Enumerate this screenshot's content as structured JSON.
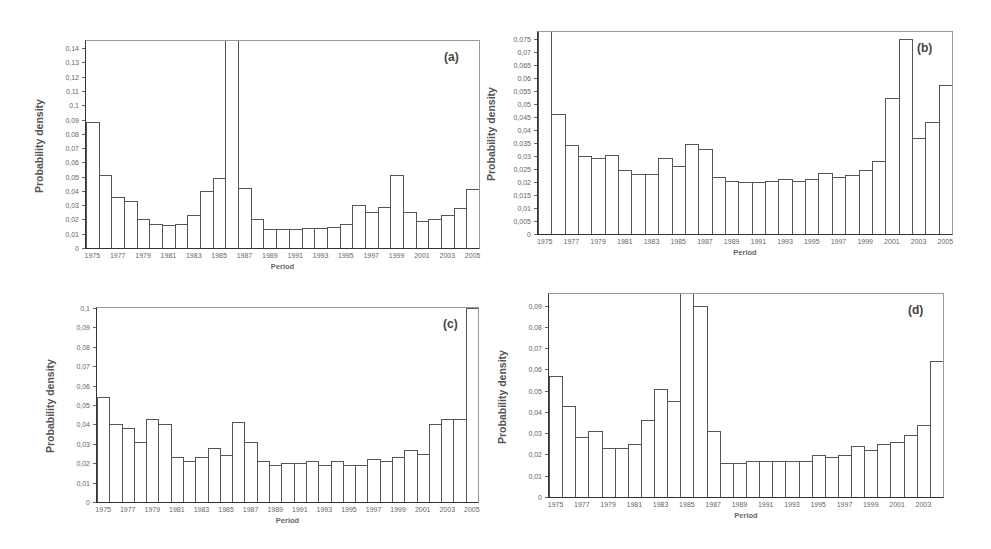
{
  "chart_data": [
    {
      "id": "a",
      "type": "bar",
      "panel_label": "(a)",
      "title": "",
      "xlabel": "Period",
      "ylabel": "Probability density",
      "ylim": [
        0,
        0.145
      ],
      "yticks": [
        "0",
        "0,01",
        "0,02",
        "0,03",
        "0,04",
        "0,05",
        "0,06",
        "0,07",
        "0,08",
        "0,09",
        "0,1",
        "0,11",
        "0,12",
        "0,13",
        "0,14"
      ],
      "ytick_values": [
        0,
        0.01,
        0.02,
        0.03,
        0.04,
        0.05,
        0.06,
        0.07,
        0.08,
        0.09,
        0.1,
        0.11,
        0.12,
        0.13,
        0.14
      ],
      "xtick_labels": [
        "1975",
        "1977",
        "1979",
        "1981",
        "1983",
        "1985",
        "1987",
        "1989",
        "1991",
        "1993",
        "1995",
        "1997",
        "1999",
        "2001",
        "2003",
        "2005"
      ],
      "categories": [
        "1975",
        "1976",
        "1977",
        "1978",
        "1979",
        "1980",
        "1981",
        "1982",
        "1983",
        "1984",
        "1985",
        "1986",
        "1987",
        "1988",
        "1989",
        "1990",
        "1991",
        "1992",
        "1993",
        "1994",
        "1995",
        "1996",
        "1997",
        "1998",
        "1999",
        "2000",
        "2001",
        "2002",
        "2003",
        "2004",
        "2005"
      ],
      "values": [
        0.088,
        0.051,
        0.036,
        0.033,
        0.02,
        0.017,
        0.016,
        0.017,
        0.023,
        0.04,
        0.049,
        0.15,
        0.042,
        0.02,
        0.013,
        0.013,
        0.013,
        0.014,
        0.014,
        0.015,
        0.017,
        0.03,
        0.025,
        0.029,
        0.051,
        0.025,
        0.019,
        0.02,
        0.023,
        0.028,
        0.041
      ],
      "grid": false,
      "legend": null
    },
    {
      "id": "b",
      "type": "bar",
      "panel_label": "(b)",
      "title": "",
      "xlabel": "Period",
      "ylabel": "Probability density",
      "ylim": [
        0,
        0.0775
      ],
      "yticks": [
        "0",
        "0,005",
        "0,01",
        "0,015",
        "0,02",
        "0,025",
        "0,03",
        "0,035",
        "0,04",
        "0,045",
        "0,05",
        "0,055",
        "0,06",
        "0,065",
        "0,07",
        "0,075"
      ],
      "ytick_values": [
        0,
        0.005,
        0.01,
        0.015,
        0.02,
        0.025,
        0.03,
        0.035,
        0.04,
        0.045,
        0.05,
        0.055,
        0.06,
        0.065,
        0.07,
        0.075
      ],
      "xtick_labels": [
        "1975",
        "1977",
        "1979",
        "1981",
        "1983",
        "1985",
        "1987",
        "1989",
        "1991",
        "1993",
        "1995",
        "1997",
        "1999",
        "2001",
        "2003",
        "2005"
      ],
      "categories": [
        "1975",
        "1976",
        "1977",
        "1978",
        "1979",
        "1980",
        "1981",
        "1982",
        "1983",
        "1984",
        "1985",
        "1986",
        "1987",
        "1988",
        "1989",
        "1990",
        "1991",
        "1992",
        "1993",
        "1994",
        "1995",
        "1996",
        "1997",
        "1998",
        "1999",
        "2000",
        "2001",
        "2002",
        "2003",
        "2004",
        "2005"
      ],
      "values": [
        0.08,
        0.046,
        0.034,
        0.03,
        0.029,
        0.0305,
        0.0245,
        0.023,
        0.023,
        0.029,
        0.026,
        0.0345,
        0.0325,
        0.022,
        0.0205,
        0.02,
        0.02,
        0.0205,
        0.021,
        0.0205,
        0.021,
        0.0235,
        0.022,
        0.0225,
        0.0245,
        0.028,
        0.052,
        0.075,
        0.037,
        0.043,
        0.057
      ],
      "grid": false,
      "legend": null
    },
    {
      "id": "c",
      "type": "bar",
      "panel_label": "(c)",
      "title": "",
      "xlabel": "Period",
      "ylabel": "Probability density",
      "ylim": [
        0,
        0.1
      ],
      "yticks": [
        "0",
        "0,01",
        "0,02",
        "0,03",
        "0,04",
        "0,05",
        "0,06",
        "0,07",
        "0,08",
        "0,09",
        "0,1"
      ],
      "ytick_values": [
        0,
        0.01,
        0.02,
        0.03,
        0.04,
        0.05,
        0.06,
        0.07,
        0.08,
        0.09,
        0.1
      ],
      "xtick_labels": [
        "1975",
        "1977",
        "1979",
        "1981",
        "1983",
        "1985",
        "1987",
        "1989",
        "1991",
        "1993",
        "1995",
        "1997",
        "1999",
        "2001",
        "2003",
        "2005"
      ],
      "categories": [
        "1975",
        "1976",
        "1977",
        "1978",
        "1979",
        "1980",
        "1981",
        "1982",
        "1983",
        "1984",
        "1985",
        "1986",
        "1987",
        "1988",
        "1989",
        "1990",
        "1991",
        "1992",
        "1993",
        "1994",
        "1995",
        "1996",
        "1997",
        "1998",
        "1999",
        "2000",
        "2001",
        "2002",
        "2003",
        "2004",
        "2005"
      ],
      "values": [
        0.054,
        0.04,
        0.038,
        0.031,
        0.043,
        0.04,
        0.023,
        0.021,
        0.023,
        0.028,
        0.024,
        0.041,
        0.031,
        0.021,
        0.019,
        0.02,
        0.02,
        0.021,
        0.019,
        0.021,
        0.019,
        0.019,
        0.022,
        0.021,
        0.023,
        0.027,
        0.025,
        0.04,
        0.043,
        0.043,
        0.1
      ],
      "grid": false,
      "legend": null
    },
    {
      "id": "d",
      "type": "bar",
      "panel_label": "(d)",
      "title": "",
      "xlabel": "Period",
      "ylabel": "Probability density",
      "ylim": [
        0,
        0.0955
      ],
      "yticks": [
        "0",
        "0,01",
        "0,02",
        "0,03",
        "0,04",
        "0,05",
        "0,06",
        "0,07",
        "0,08",
        "0,09"
      ],
      "ytick_values": [
        0,
        0.01,
        0.02,
        0.03,
        0.04,
        0.05,
        0.06,
        0.07,
        0.08,
        0.09
      ],
      "xtick_labels": [
        "1975",
        "1977",
        "1979",
        "1981",
        "1983",
        "1985",
        "1987",
        "1989",
        "1991",
        "1993",
        "1995",
        "1997",
        "1999",
        "2001",
        "2003"
      ],
      "categories": [
        "1975",
        "1976",
        "1977",
        "1978",
        "1979",
        "1980",
        "1981",
        "1982",
        "1983",
        "1984",
        "1985",
        "1986",
        "1987",
        "1988",
        "1989",
        "1990",
        "1991",
        "1992",
        "1993",
        "1994",
        "1995",
        "1996",
        "1997",
        "1998",
        "1999",
        "2000",
        "2001",
        "2002",
        "2003",
        "2004"
      ],
      "values": [
        0.057,
        0.043,
        0.028,
        0.031,
        0.023,
        0.023,
        0.025,
        0.036,
        0.051,
        0.045,
        0.1,
        0.09,
        0.031,
        0.016,
        0.016,
        0.017,
        0.017,
        0.017,
        0.017,
        0.017,
        0.02,
        0.019,
        0.02,
        0.024,
        0.022,
        0.025,
        0.026,
        0.029,
        0.034,
        0.064
      ],
      "grid": false,
      "legend": null
    }
  ],
  "layout": [
    {
      "left": 85,
      "top": 40,
      "width": 395,
      "height": 209
    },
    {
      "left": 537,
      "top": 31,
      "width": 416,
      "height": 204
    },
    {
      "left": 96,
      "top": 307,
      "width": 383,
      "height": 196
    },
    {
      "left": 548,
      "top": 293,
      "width": 396,
      "height": 205
    }
  ]
}
